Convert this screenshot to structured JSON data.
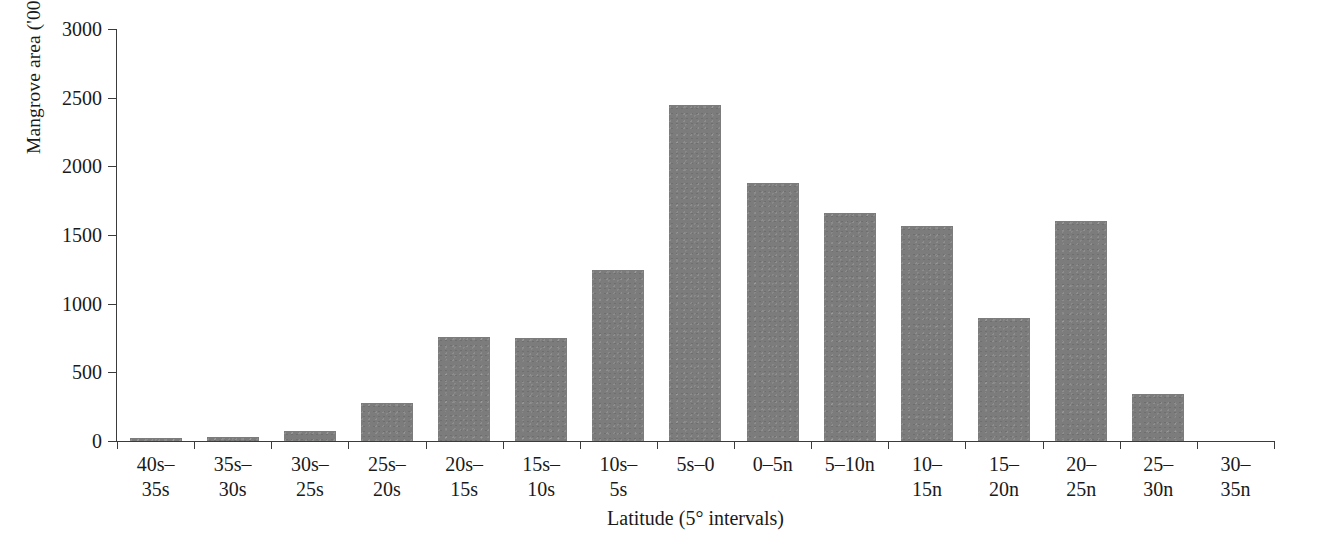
{
  "chart_data": {
    "type": "bar",
    "title": "",
    "xlabel": "Latitude (5° intervals)",
    "ylabel": "Mangrove area ('000 Ha)",
    "ylim": [
      0,
      3000
    ],
    "yticks": [
      0,
      500,
      1000,
      1500,
      2000,
      2500,
      3000
    ],
    "ytick_labels": [
      "0",
      "500",
      "1000",
      "1500",
      "2000",
      "2500",
      "3000"
    ],
    "grid": false,
    "legend": null,
    "bar_color": "#7c7c7c",
    "axis_color": "#3b3b3b",
    "categories": [
      "40s–\n35s",
      "35s–\n30s",
      "30s–\n25s",
      "25s–\n20s",
      "20s–\n15s",
      "15s–\n10s",
      "10s–\n5s",
      "5s–0",
      "0–5n",
      "5–10n",
      "10–\n15n",
      "15–\n20n",
      "20–\n25n",
      "25–\n30n",
      "30–\n35n"
    ],
    "values": [
      25,
      28,
      70,
      280,
      760,
      750,
      1245,
      2450,
      1880,
      1660,
      1565,
      895,
      1605,
      345,
      0
    ]
  }
}
